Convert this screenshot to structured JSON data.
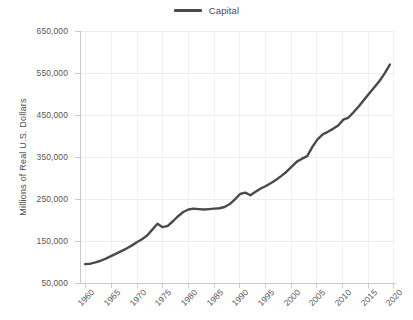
{
  "legend": {
    "entries": [
      {
        "label": "Capital",
        "color": "#4a4a4a",
        "swatch": "line-swatch"
      }
    ],
    "position": "top-center"
  },
  "axes": {
    "ylabel": "Millions of Real U.S. Dollars",
    "xlabel": "",
    "yticks": [
      "50,000",
      "150,000",
      "250,000",
      "350,000",
      "450,000",
      "550,000",
      "650,000"
    ],
    "ytick_values": [
      50000,
      150000,
      250000,
      350000,
      450000,
      550000,
      650000
    ],
    "xticks": [
      "1960",
      "1965",
      "1970",
      "1975",
      "1980",
      "1985",
      "1990",
      "1995",
      "2000",
      "2005",
      "2010",
      "2015",
      "2020"
    ],
    "xtick_values": [
      1960,
      1965,
      1970,
      1975,
      1980,
      1985,
      1990,
      1995,
      2000,
      2005,
      2010,
      2015,
      2020
    ]
  },
  "chart_data": {
    "type": "line",
    "title": "",
    "subtitle": "",
    "xlabel": "",
    "ylabel": "Millions of Real U.S. Dollars",
    "xlim": [
      1959,
      2020
    ],
    "ylim": [
      50000,
      650000
    ],
    "grid": true,
    "legend_position": "top-center",
    "x": [
      1960,
      1961,
      1962,
      1963,
      1964,
      1965,
      1966,
      1967,
      1968,
      1969,
      1970,
      1971,
      1972,
      1973,
      1974,
      1975,
      1976,
      1977,
      1978,
      1979,
      1980,
      1981,
      1982,
      1983,
      1984,
      1985,
      1986,
      1987,
      1988,
      1989,
      1990,
      1991,
      1992,
      1993,
      1994,
      1995,
      1996,
      1997,
      1998,
      1999,
      2000,
      2001,
      2002,
      2003,
      2004,
      2005,
      2006,
      2007,
      2008,
      2009,
      2010,
      2011,
      2012,
      2013,
      2014,
      2015,
      2016,
      2017,
      2018,
      2019
    ],
    "series": [
      {
        "name": "Capital",
        "color": "#4a4a4a",
        "values": [
          95000,
          96000,
          99000,
          103000,
          108000,
          114000,
          120000,
          126000,
          132000,
          139000,
          147000,
          154000,
          163000,
          177000,
          191000,
          183000,
          186000,
          197000,
          209000,
          219000,
          225000,
          227000,
          226000,
          225000,
          226000,
          227000,
          228000,
          231000,
          238000,
          249000,
          262000,
          265000,
          259000,
          267000,
          275000,
          281000,
          288000,
          296000,
          305000,
          315000,
          327000,
          339000,
          346000,
          352000,
          374000,
          392000,
          404000,
          410000,
          417000,
          425000,
          439000,
          444000,
          457000,
          471000,
          486000,
          501000,
          516000,
          531000,
          549000,
          570000
        ]
      }
    ]
  }
}
